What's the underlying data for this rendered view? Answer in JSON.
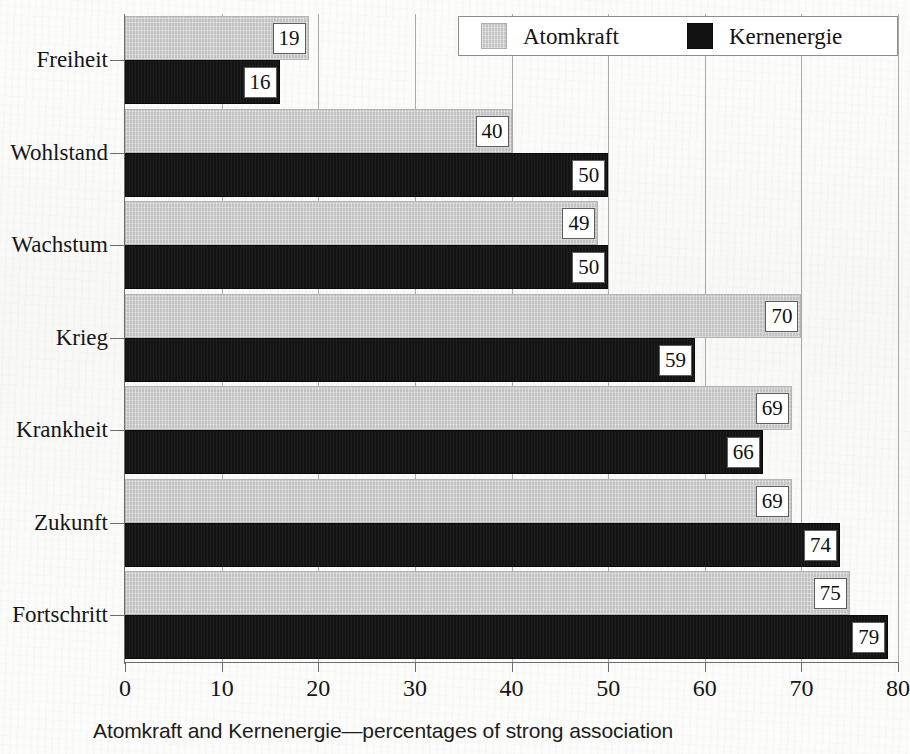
{
  "chart_data": {
    "type": "bar",
    "orientation": "horizontal",
    "title": "",
    "caption": "Atomkraft and Kernenergie—percentages of strong association",
    "xlabel": "",
    "ylabel": "",
    "xlim": [
      0,
      80
    ],
    "xticks": [
      "0",
      "10",
      "20",
      "30",
      "40",
      "50",
      "60",
      "70",
      "80"
    ],
    "grid": "vertical",
    "legend_position": "top-right",
    "categories": [
      "Freiheit",
      "Wohlstand",
      "Wachstum",
      "Krieg",
      "Krankheit",
      "Zukunft",
      "Fortschritt"
    ],
    "series": [
      {
        "name": "Atomkraft",
        "color": "#cccccc",
        "values": [
          19,
          40,
          49,
          70,
          69,
          69,
          75
        ]
      },
      {
        "name": "Kernenergie",
        "color": "#141414",
        "values": [
          16,
          50,
          50,
          59,
          66,
          74,
          79
        ]
      }
    ]
  },
  "legend": {
    "entries": [
      {
        "label": "Atomkraft",
        "swatch": "light-gray-swatch"
      },
      {
        "label": "Kernenergie",
        "swatch": "black-swatch"
      }
    ]
  },
  "axis": {
    "x_tick_labels": [
      "0",
      "10",
      "20",
      "30",
      "40",
      "50",
      "60",
      "70",
      "80"
    ]
  },
  "colors": {
    "atomkraft": "#cccccc",
    "kernenergie": "#141414",
    "axis": "#6d6d6d",
    "gridline": "#a9a9a9",
    "paper": "#fbfbfa"
  }
}
